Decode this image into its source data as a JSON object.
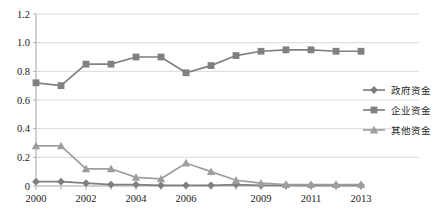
{
  "chart_data": {
    "type": "line",
    "title": "",
    "subtitle": "",
    "xlabel": "",
    "ylabel": "",
    "x": [
      2000,
      2001,
      2002,
      2003,
      2004,
      2005,
      2006,
      2007,
      2008,
      2009,
      2010,
      2011,
      2012,
      2013
    ],
    "categories": [
      "2000",
      "2001",
      "2002",
      "2003",
      "2004",
      "2005",
      "2006",
      "2007",
      "2008",
      "2009",
      "2010",
      "2011",
      "2012",
      "2013"
    ],
    "xtick_labels": [
      "2000",
      "2002",
      "2004",
      "2006",
      "2009",
      "2011",
      "2013"
    ],
    "xtick_values": [
      2000,
      2002,
      2004,
      2006,
      2009,
      2011,
      2013
    ],
    "ytick_labels": [
      "0",
      "0.2",
      "0.4",
      "0.6",
      "0.8",
      "1.0",
      "1.2"
    ],
    "ytick_values": [
      0,
      0.2,
      0.4,
      0.6,
      0.8,
      1.0,
      1.2
    ],
    "ylim": [
      0,
      1.2
    ],
    "xlim": [
      2000,
      2013
    ],
    "grid": "horizontal",
    "legend_position": "right",
    "series": [
      {
        "name": "政府资金",
        "marker": "diamond",
        "color": "#7f7f7f",
        "values": [
          0.03,
          0.03,
          0.02,
          0.01,
          0.01,
          0.005,
          0.005,
          0.005,
          0.01,
          0.005,
          0.005,
          0.005,
          0.005,
          0.005
        ]
      },
      {
        "name": "企业资金",
        "marker": "square",
        "color": "#808080",
        "values": [
          0.72,
          0.7,
          0.85,
          0.85,
          0.9,
          0.9,
          0.79,
          0.84,
          0.91,
          0.94,
          0.95,
          0.95,
          0.94,
          0.94
        ]
      },
      {
        "name": "其他资金",
        "marker": "triangle",
        "color": "#9e9e9e",
        "values": [
          0.28,
          0.28,
          0.12,
          0.12,
          0.06,
          0.05,
          0.16,
          0.1,
          0.04,
          0.02,
          0.01,
          0.01,
          0.01,
          0.01
        ]
      }
    ]
  },
  "legend": {
    "items": [
      {
        "label": "政府资金",
        "marker": "diamond",
        "color": "#7f7f7f"
      },
      {
        "label": "企业资金",
        "marker": "square",
        "color": "#808080"
      },
      {
        "label": "其他资金",
        "marker": "triangle",
        "color": "#9e9e9e"
      }
    ]
  },
  "colors": {
    "government": "#7f7f7f",
    "enterprise": "#808080",
    "other": "#9e9e9e",
    "grid": "#c9c9c9",
    "axis": "#9a9a9a",
    "background": "#ffffff",
    "text": "#1a1a1a"
  }
}
